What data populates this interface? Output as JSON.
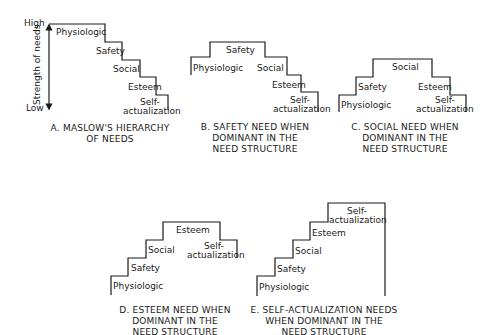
{
  "axis": {
    "high": "High",
    "low": "Low",
    "label": "Strength of needs"
  },
  "panels": [
    {
      "id": "A",
      "caption": [
        "A.  MASLOW'S HIERARCHY",
        "OF NEEDS"
      ],
      "labels": {
        "physiologic": "Physiologic",
        "safety": "Safety",
        "social": "Social",
        "esteem": "Esteem",
        "self1": "Self-",
        "self2": "actualization"
      }
    },
    {
      "id": "B",
      "caption": [
        "B.  SAFETY NEED WHEN",
        "DOMINANT IN THE",
        "NEED STRUCTURE"
      ],
      "labels": {
        "physiologic": "Physiologic",
        "safety": "Safety",
        "social": "Social",
        "esteem": "Esteem",
        "self1": "Self-",
        "self2": "actualization"
      }
    },
    {
      "id": "C",
      "caption": [
        "C.  SOCIAL NEED WHEN",
        "DOMINANT IN THE",
        "NEED STRUCTURE"
      ],
      "labels": {
        "physiologic": "Physiologic",
        "safety": "Safety",
        "social": "Social",
        "esteem": "Esteem",
        "self1": "Self-",
        "self2": "actualization"
      }
    },
    {
      "id": "D",
      "caption": [
        "D.  ESTEEM NEED WHEN",
        "DOMINANT IN THE",
        "NEED STRUCTURE"
      ],
      "labels": {
        "physiologic": "Physiologic",
        "safety": "Safety",
        "social": "Social",
        "esteem": "Esteem",
        "self1": "Self-",
        "self2": "actualization"
      }
    },
    {
      "id": "E",
      "caption": [
        "E.  SELF-ACTUALIZATION NEEDS",
        "WHEN DOMINANT IN THE",
        "NEED STRUCTURE"
      ],
      "labels": {
        "physiologic": "Physiologic",
        "safety": "Safety",
        "social": "Social",
        "esteem": "Esteem",
        "self1": "Self-",
        "self2": "actualization"
      }
    }
  ],
  "colors": {
    "line": "#1a1a1a",
    "background": "#ffffff"
  }
}
